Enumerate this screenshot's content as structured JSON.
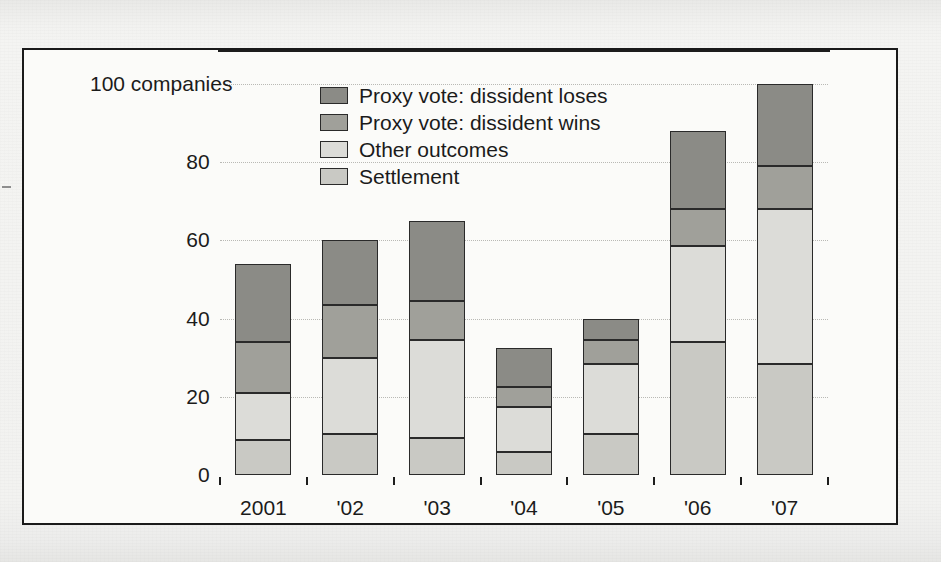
{
  "chart_data": {
    "type": "bar",
    "subtype": "stacked-bar",
    "title": "",
    "xlabel": "",
    "ylabel": "companies",
    "y_unit_label": "100 companies",
    "categories": [
      "2001",
      "'02",
      "'03",
      "'04",
      "'05",
      "'06",
      "'07"
    ],
    "ylim": [
      0,
      100
    ],
    "ytick_labels": [
      "0",
      "20",
      "40",
      "60",
      "80",
      "100"
    ],
    "ytick_values": [
      0,
      20,
      40,
      60,
      80,
      100
    ],
    "grid": true,
    "grid_style": "dotted-horizontal",
    "legend_position": "top-center",
    "stack_order_bottom_to_top": [
      "Settlement",
      "Other outcomes",
      "Proxy vote: dissident wins",
      "Proxy vote: dissident loses"
    ],
    "series": [
      {
        "name": "Settlement",
        "color": "#c9c9c4",
        "values": [
          9,
          10.5,
          9.5,
          6,
          10.5,
          34,
          28.5
        ]
      },
      {
        "name": "Other outcomes",
        "color": "#dcdcd8",
        "values": [
          12,
          19.5,
          25,
          11.5,
          18,
          24.5,
          39.5
        ]
      },
      {
        "name": "Proxy vote: dissident wins",
        "color": "#a0a09a",
        "values": [
          13,
          13.5,
          10,
          5,
          6,
          9.5,
          11
        ]
      },
      {
        "name": "Proxy vote: dissident loses",
        "color": "#8b8b86",
        "values": [
          20,
          16.5,
          20.5,
          10,
          5.5,
          20,
          21
        ]
      }
    ],
    "totals": [
      54,
      60,
      65,
      32.5,
      40,
      88,
      100
    ],
    "annotations": []
  },
  "legend": {
    "items": [
      {
        "label": "Proxy vote: dissident loses",
        "color": "#8b8b86"
      },
      {
        "label": "Proxy vote: dissident wins",
        "color": "#a0a09a"
      },
      {
        "label": "Other outcomes",
        "color": "#dcdcd8"
      },
      {
        "label": "Settlement",
        "color": "#c9c9c4"
      }
    ]
  },
  "colors": {
    "frame_border": "#1a1a1a",
    "axis": "#1d1d1d",
    "gridline": "#b9b9b5",
    "text": "#1b1b1b",
    "plot_background": "#fbfbf9",
    "page_background": "#f3f3f1"
  }
}
